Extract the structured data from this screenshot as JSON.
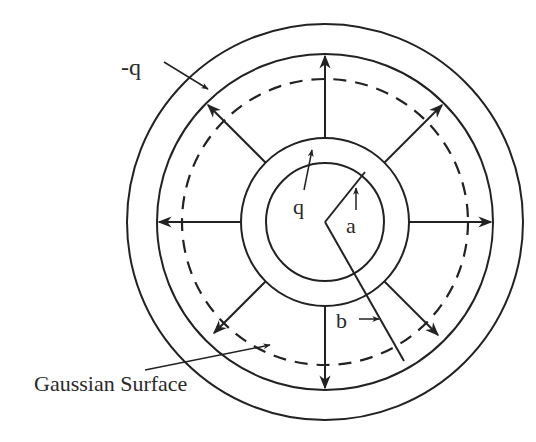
{
  "figure": {
    "colors": {
      "ink": "#222222",
      "background": "#ffffff"
    },
    "labels": {
      "outer_charge": "-q",
      "inner_charge": "q",
      "inner_radius": "a",
      "gaussian_radius": "b",
      "gaussian_surface": "Gaussian Surface"
    },
    "geometry": {
      "center": [
        325,
        222
      ],
      "outer_shell_outer_radius": 198,
      "outer_shell_inner_radius": 168,
      "gaussian_surface_radius": 143,
      "inner_shell_outer_radius": 84,
      "inner_conductor_radius": 59
    },
    "field_arrows": {
      "count": 8,
      "angles_deg": [
        0,
        45,
        90,
        135,
        180,
        225,
        270,
        315
      ],
      "direction": "radially outward"
    }
  }
}
